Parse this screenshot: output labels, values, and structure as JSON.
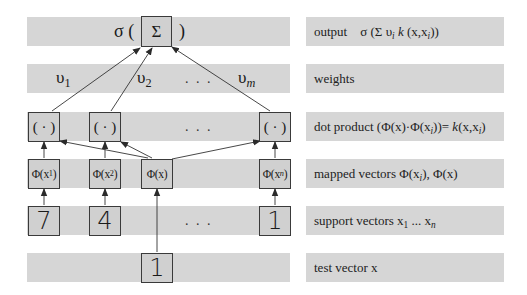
{
  "diagram": {
    "type": "support-vector-machine-architecture",
    "layers": [
      {
        "id": "output",
        "label": "output",
        "formula": "σ (Σ υ",
        "formula_sub": "i",
        "formula_rest": " k (x,x",
        "formula_sub2": "i",
        "formula_end": "))"
      },
      {
        "id": "weights",
        "label": "weights"
      },
      {
        "id": "dot_product",
        "label": "dot product (Φ(x)·Φ(x",
        "label_sub": "i",
        "label_mid": "))= ",
        "label_k": "k",
        "label_end": "(x,x",
        "label_sub2": "i",
        "label_close": ")"
      },
      {
        "id": "mapped_vectors",
        "label": "mapped vectors Φ(x",
        "label_sub": "i",
        "label_end": "), Φ(x)"
      },
      {
        "id": "support_vectors",
        "label": "support vectors x",
        "label_sub": "1",
        "label_mid": " ... x",
        "label_sub2": "n"
      },
      {
        "id": "test_vector",
        "label": "test vector x"
      }
    ],
    "output_node": {
      "prefix": "σ (",
      "symbol": "Σ",
      "suffix": ")"
    },
    "weights": [
      {
        "symbol": "υ",
        "sub": "1"
      },
      {
        "symbol": "υ",
        "sub": "2"
      },
      {
        "symbol": "υ",
        "sub": "m"
      }
    ],
    "ellipsis": ". . .",
    "dot_nodes": [
      "( · )",
      "( · )",
      "( · )"
    ],
    "mapped_nodes": [
      {
        "text": "Φ(x",
        "sub": "1",
        "close": ")"
      },
      {
        "text": "Φ(x",
        "sub": "2",
        "close": ")"
      },
      {
        "text": "Φ(x)",
        "sub": "",
        "close": ""
      },
      {
        "text": "Φ(x",
        "sub": "n",
        "close": ")"
      }
    ],
    "support_vector_digits": [
      "7",
      "4",
      "1"
    ],
    "test_vector_digit": "1",
    "colors": {
      "band": "#d6d6d6",
      "box_fill": "#d0d0d0",
      "box_border": "#3a3a3a",
      "arrow": "#333333"
    }
  }
}
